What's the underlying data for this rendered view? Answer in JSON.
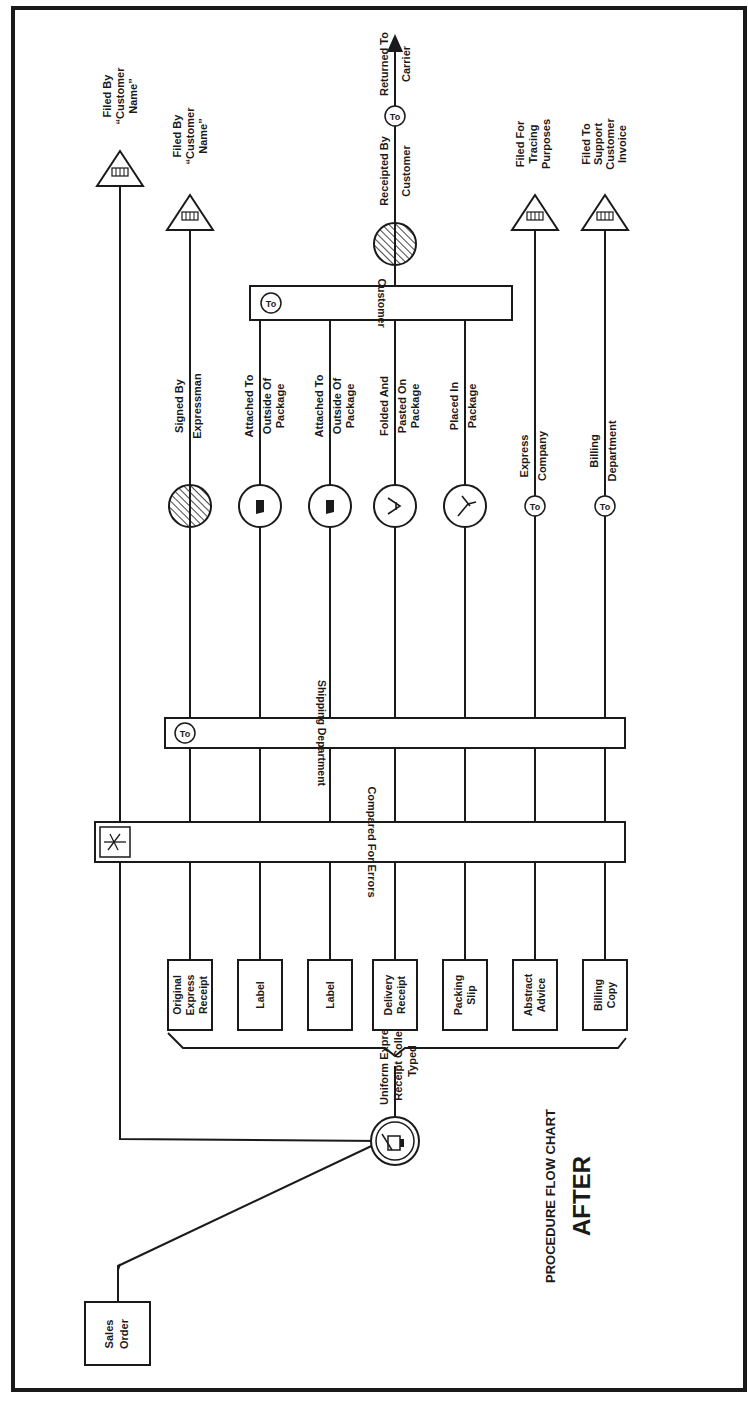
{
  "chart": {
    "title": "PROCEDURE FLOW CHART",
    "subtitle": "AFTER",
    "source": {
      "label": [
        "Sales",
        "Order"
      ]
    },
    "typing_step": {
      "label": [
        "Uniform Express",
        "Receipt Collect",
        "Typed"
      ]
    },
    "documents": [
      {
        "id": "original-express-receipt",
        "label": [
          "Original",
          "Express",
          "Receipt"
        ]
      },
      {
        "id": "label-1",
        "label": [
          "Label"
        ]
      },
      {
        "id": "label-2",
        "label": [
          "Label"
        ]
      },
      {
        "id": "delivery-receipt",
        "label": [
          "Delivery",
          "Receipt"
        ]
      },
      {
        "id": "packing-slip",
        "label": [
          "Packing",
          "Slip"
        ]
      },
      {
        "id": "abstract-advice",
        "label": [
          "Abstract",
          "Advice"
        ]
      },
      {
        "id": "billing-copy",
        "label": [
          "Billing",
          "Copy"
        ]
      }
    ],
    "compare_step": {
      "label": "Compared For Errors"
    },
    "shipping_transfer": {
      "to": "To",
      "label": "Shipping Department"
    },
    "customer_transfer": {
      "to": "To",
      "label": "Customer"
    },
    "sales_order_file": {
      "label": [
        "Filed By",
        "“Customer",
        "Name”"
      ]
    },
    "row_actions": {
      "original": {
        "op": [
          "Signed By",
          "Expressman"
        ],
        "file": [
          "Filed By",
          "“Customer",
          "Name”"
        ]
      },
      "label1": {
        "op": [
          "Attached  To",
          "Outside Of",
          "Package"
        ]
      },
      "label2": {
        "op": [
          "Attached To",
          "Outside Of",
          "Package"
        ]
      },
      "delivery": {
        "op": [
          "Folded  And",
          "Pasted  On",
          "Package"
        ],
        "receipt": [
          "Receipted  By",
          "Customer"
        ],
        "return_to": "To",
        "return": [
          "Returned  To",
          "Carrier"
        ]
      },
      "packing": {
        "op": [
          "Placed In",
          "Package"
        ]
      },
      "abstract": {
        "to": "To",
        "dest": [
          "Express",
          "Company"
        ],
        "file": [
          "Filed For",
          "Tracing",
          "Purposes"
        ]
      },
      "billing": {
        "to": "To",
        "dest": [
          "Billing",
          "Department"
        ],
        "file": [
          "Filed To",
          "Support",
          "Customer",
          "Invoice"
        ]
      }
    }
  }
}
